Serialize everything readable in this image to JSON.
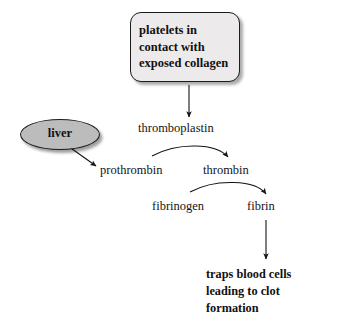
{
  "diagram": {
    "background_color": "#ffffff",
    "stimulus_box": {
      "text": "platelets in\ncontact with\nexposed collagen",
      "fill_color": "#eceaea",
      "border_color": "#1c1c1c",
      "shape": "rounded-rectangle-with-shadow"
    },
    "liver_node": {
      "label": "liver",
      "fill_color": "#bcbcbc",
      "border_color": "#1c1c1c",
      "shape": "ellipse-with-shadow"
    },
    "flow_labels": {
      "thromboplastin": "thromboplastin",
      "prothrombin": "prothrombin",
      "thrombin": "thrombin",
      "fibrinogen": "fibrinogen",
      "fibrin": "fibrin"
    },
    "outcome": {
      "text": "traps blood cells\nleading to clot\nformation"
    },
    "arrows": [
      {
        "name": "box-to-thromboplastin",
        "from": "platelets in contact with exposed collagen",
        "to": "thromboplastin",
        "style": "straight-vertical"
      },
      {
        "name": "liver-to-prothrombin",
        "from": "liver",
        "to": "prothrombin",
        "style": "straight-diagonal"
      },
      {
        "name": "thromboplastin-to-thrombin",
        "from": "prothrombin",
        "to": "thrombin",
        "style": "curved-arc",
        "catalyst": "thromboplastin"
      },
      {
        "name": "fibrinogen-to-fibrin",
        "from": "fibrinogen",
        "to": "fibrin",
        "style": "curved-arc",
        "catalyst": "thrombin"
      },
      {
        "name": "fibrin-to-outcome",
        "from": "fibrin",
        "to": "traps blood cells leading to clot formation",
        "style": "straight-vertical"
      }
    ]
  }
}
